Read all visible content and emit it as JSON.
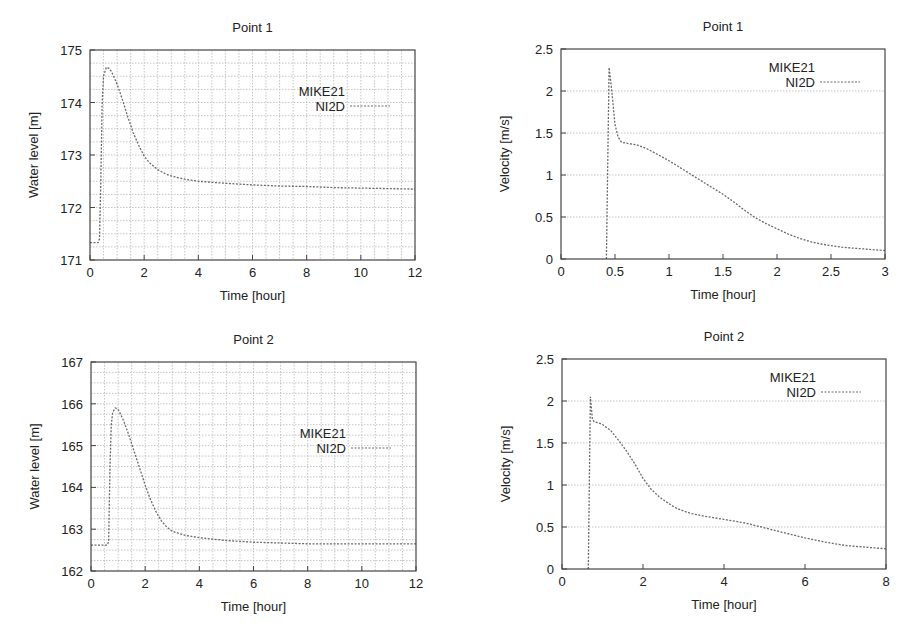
{
  "figure": {
    "background": "#ffffff",
    "frame_color": "#444444",
    "grid_color": "#b8b8b8",
    "line_color": "#6a6a6a",
    "legend": {
      "entries": [
        "MIKE21",
        "NI2D"
      ]
    }
  },
  "chart_data": [
    {
      "id": "wl-p1",
      "type": "line",
      "title": "Point 1",
      "xlabel": "Time [hour]",
      "ylabel": "Water level [m]",
      "xlim": [
        0,
        12
      ],
      "ylim": [
        171,
        175
      ],
      "xticks": [
        0,
        2,
        4,
        6,
        8,
        10,
        12
      ],
      "xtick_labels": [
        "0",
        "2",
        "4",
        "6",
        "8",
        "10",
        "12"
      ],
      "yticks": [
        171,
        172,
        173,
        174,
        175
      ],
      "ytick_labels": [
        "171",
        "172",
        "173",
        "174",
        "175"
      ],
      "grid": {
        "x_step": 0.5,
        "y_step": 0.25,
        "on": true
      },
      "legend": {
        "position": "upper right",
        "entries": [
          "MIKE21",
          "NI2D"
        ]
      },
      "box": {
        "left": 90,
        "top": 50,
        "right": 415,
        "bottom": 260
      },
      "series": [
        {
          "name": "MIKE21",
          "style": "solid",
          "x": [],
          "y": []
        },
        {
          "name": "NI2D",
          "style": "dashed",
          "x": [
            0,
            0.3,
            0.35,
            0.4,
            0.45,
            0.5,
            0.6,
            0.7,
            0.8,
            1.0,
            1.2,
            1.4,
            1.6,
            1.8,
            2.0,
            2.2,
            2.5,
            2.8,
            3.0,
            3.5,
            4.0,
            4.5,
            5.0,
            6.0,
            7.0,
            8.0,
            9.0,
            10.0,
            11.0,
            12.0
          ],
          "y": [
            171.33,
            171.33,
            171.4,
            172.5,
            174.0,
            174.5,
            174.67,
            174.65,
            174.58,
            174.35,
            174.05,
            173.72,
            173.42,
            173.18,
            172.98,
            172.85,
            172.72,
            172.64,
            172.6,
            172.54,
            172.5,
            172.48,
            172.46,
            172.43,
            172.41,
            172.4,
            172.38,
            172.37,
            172.36,
            172.35
          ]
        }
      ]
    },
    {
      "id": "vel-p1",
      "type": "line",
      "title": "Point 1",
      "xlabel": "Time [hour]",
      "ylabel": "Velocity [m/s]",
      "xlim": [
        0,
        3
      ],
      "ylim": [
        0,
        2.5
      ],
      "xticks": [
        0,
        0.5,
        1,
        1.5,
        2,
        2.5,
        3
      ],
      "xtick_labels": [
        "0",
        "0.5",
        "1",
        "1.5",
        "2",
        "2.5",
        "3"
      ],
      "yticks": [
        0,
        0.5,
        1,
        1.5,
        2,
        2.5
      ],
      "ytick_labels": [
        "0",
        "0.5",
        "1",
        "1.5",
        "2",
        "2.5"
      ],
      "grid": {
        "y_step": 0.5,
        "on": true,
        "horizontal_only": true
      },
      "legend": {
        "position": "upper right",
        "entries": [
          "MIKE21",
          "NI2D"
        ]
      },
      "box": {
        "left": 561,
        "top": 49,
        "right": 885,
        "bottom": 259
      },
      "series": [
        {
          "name": "MIKE21",
          "style": "solid",
          "x": [],
          "y": []
        },
        {
          "name": "NI2D",
          "style": "dashed",
          "x": [
            0.42,
            0.445,
            0.47,
            0.5,
            0.53,
            0.56,
            0.6,
            0.7,
            0.8,
            0.9,
            1.0,
            1.1,
            1.2,
            1.3,
            1.4,
            1.5,
            1.6,
            1.7,
            1.8,
            1.9,
            2.0,
            2.1,
            2.2,
            2.3,
            2.4,
            2.5,
            2.6,
            2.7,
            2.8,
            2.9,
            3.0
          ],
          "y": [
            0.0,
            2.28,
            2.0,
            1.6,
            1.45,
            1.39,
            1.38,
            1.36,
            1.31,
            1.24,
            1.17,
            1.09,
            1.01,
            0.93,
            0.85,
            0.77,
            0.68,
            0.58,
            0.49,
            0.42,
            0.36,
            0.3,
            0.25,
            0.21,
            0.18,
            0.16,
            0.14,
            0.13,
            0.12,
            0.11,
            0.1
          ]
        }
      ]
    },
    {
      "id": "wl-p2",
      "type": "line",
      "title": "Point 2",
      "xlabel": "Time [hour]",
      "ylabel": "Water level [m]",
      "xlim": [
        0,
        12
      ],
      "ylim": [
        162,
        167
      ],
      "xticks": [
        0,
        2,
        4,
        6,
        8,
        10,
        12
      ],
      "xtick_labels": [
        "0",
        "2",
        "4",
        "6",
        "8",
        "10",
        "12"
      ],
      "yticks": [
        162,
        163,
        164,
        165,
        166,
        167
      ],
      "ytick_labels": [
        "162",
        "163",
        "164",
        "165",
        "166",
        "167"
      ],
      "grid": {
        "x_step": 0.5,
        "y_step": 0.25,
        "on": true
      },
      "legend": {
        "position": "upper right",
        "entries": [
          "MIKE21",
          "NI2D"
        ]
      },
      "box": {
        "left": 91,
        "top": 362,
        "right": 416,
        "bottom": 571
      },
      "series": [
        {
          "name": "MIKE21",
          "style": "solid",
          "x": [],
          "y": []
        },
        {
          "name": "NI2D",
          "style": "dashed",
          "x": [
            0,
            0.6,
            0.65,
            0.7,
            0.75,
            0.8,
            0.9,
            1.0,
            1.2,
            1.4,
            1.6,
            1.8,
            2.0,
            2.2,
            2.4,
            2.6,
            2.8,
            3.0,
            3.5,
            4.0,
            4.5,
            5.0,
            6.0,
            7.0,
            8.0,
            9.0,
            10.0,
            11.0,
            12.0
          ],
          "y": [
            162.62,
            162.62,
            162.7,
            164.5,
            165.5,
            165.8,
            165.9,
            165.87,
            165.6,
            165.25,
            164.85,
            164.45,
            164.05,
            163.7,
            163.42,
            163.2,
            163.05,
            162.95,
            162.85,
            162.8,
            162.76,
            162.73,
            162.69,
            162.67,
            162.65,
            162.65,
            162.65,
            162.65,
            162.65
          ]
        }
      ]
    },
    {
      "id": "vel-p2",
      "type": "line",
      "title": "Point 2",
      "xlabel": "Time [hour]",
      "ylabel": "Velocity [m/s]",
      "xlim": [
        0,
        8
      ],
      "ylim": [
        0,
        2.5
      ],
      "xticks": [
        0,
        2,
        4,
        6,
        8
      ],
      "xtick_labels": [
        "0",
        "2",
        "4",
        "6",
        "8"
      ],
      "yticks": [
        0,
        0.5,
        1,
        1.5,
        2,
        2.5
      ],
      "ytick_labels": [
        "0",
        "0.5",
        "1",
        "1.5",
        "2",
        "2.5"
      ],
      "grid": {
        "y_step": 0.5,
        "on": true,
        "horizontal_only": true
      },
      "legend": {
        "position": "upper right",
        "entries": [
          "MIKE21",
          "NI2D"
        ]
      },
      "box": {
        "left": 562,
        "top": 359,
        "right": 886,
        "bottom": 569
      },
      "series": [
        {
          "name": "MIKE21",
          "style": "solid",
          "x": [],
          "y": []
        },
        {
          "name": "NI2D",
          "style": "dashed",
          "x": [
            0.65,
            0.7,
            0.75,
            0.8,
            0.9,
            1.0,
            1.2,
            1.4,
            1.6,
            1.8,
            2.0,
            2.2,
            2.4,
            2.6,
            2.8,
            3.0,
            3.2,
            3.5,
            4.0,
            4.5,
            5.0,
            5.5,
            6.0,
            6.5,
            7.0,
            7.5,
            8.0
          ],
          "y": [
            0.0,
            2.05,
            1.78,
            1.75,
            1.74,
            1.72,
            1.65,
            1.53,
            1.4,
            1.25,
            1.08,
            0.95,
            0.86,
            0.79,
            0.73,
            0.69,
            0.66,
            0.63,
            0.59,
            0.55,
            0.49,
            0.43,
            0.37,
            0.32,
            0.28,
            0.26,
            0.24
          ]
        }
      ]
    }
  ]
}
